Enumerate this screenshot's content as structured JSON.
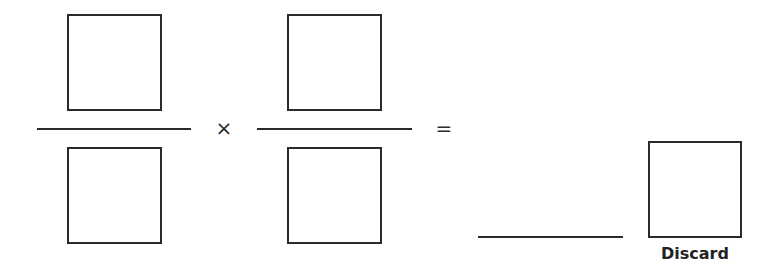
{
  "equation": {
    "fraction1": {
      "numerator_value": "",
      "denominator_value": ""
    },
    "operator": "×",
    "fraction2": {
      "numerator_value": "",
      "denominator_value": ""
    },
    "equals": "=",
    "answer_value": ""
  },
  "discard": {
    "label": "Discard",
    "value": ""
  },
  "colors": {
    "stroke": "#2b2b2b",
    "background": "#ffffff",
    "text": "#222222"
  }
}
